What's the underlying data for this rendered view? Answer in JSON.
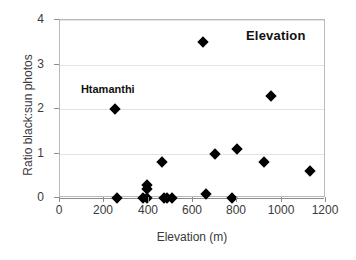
{
  "chart_data": {
    "type": "scatter",
    "title": "Elevation",
    "xlabel": "Elevation (m)",
    "ylabel": "Ratio black:sun photos",
    "xlim": [
      0,
      1200
    ],
    "ylim": [
      0,
      4
    ],
    "xticks": [
      0,
      200,
      400,
      600,
      800,
      1000,
      1200
    ],
    "yticks": [
      0,
      1,
      2,
      3,
      4
    ],
    "grid": "horizontal",
    "legend": "none",
    "marker": "diamond",
    "marker_color": "#000000",
    "points": [
      {
        "x": 250,
        "y": 2.0,
        "label": "Htamanthi"
      },
      {
        "x": 258,
        "y": 0.0
      },
      {
        "x": 375,
        "y": 0.0
      },
      {
        "x": 392,
        "y": 0.0
      },
      {
        "x": 392,
        "y": 0.2
      },
      {
        "x": 392,
        "y": 0.3
      },
      {
        "x": 460,
        "y": 0.8
      },
      {
        "x": 468,
        "y": 0.0
      },
      {
        "x": 482,
        "y": 0.0
      },
      {
        "x": 505,
        "y": 0.0
      },
      {
        "x": 645,
        "y": 3.5
      },
      {
        "x": 660,
        "y": 0.1
      },
      {
        "x": 700,
        "y": 1.0
      },
      {
        "x": 775,
        "y": 0.0
      },
      {
        "x": 800,
        "y": 1.1
      },
      {
        "x": 920,
        "y": 0.8
      },
      {
        "x": 950,
        "y": 2.3
      },
      {
        "x": 1130,
        "y": 0.6
      }
    ],
    "annotations": [
      {
        "text": "Htamanthi",
        "x": 220,
        "y": 2.43
      }
    ]
  }
}
